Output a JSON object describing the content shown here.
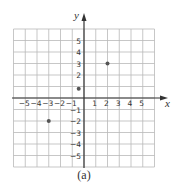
{
  "chart_data": {
    "type": "scatter",
    "title": "",
    "caption": "(a)",
    "xlabel": "x",
    "ylabel": "y",
    "xlim": [
      -6,
      6
    ],
    "ylim": [
      -6,
      6
    ],
    "grid": true,
    "x_ticks": [
      -5,
      -4,
      -3,
      -2,
      -1,
      1,
      2,
      3,
      4,
      5
    ],
    "x_tick_labels": [
      "−5",
      "−4",
      "−3",
      "−2",
      "−1",
      "1",
      "2",
      "3",
      "4",
      "5"
    ],
    "y_ticks": [
      5,
      4,
      3,
      2,
      -1,
      -2,
      -3,
      -4,
      -5
    ],
    "y_tick_labels": [
      "5",
      "4",
      "3",
      "2",
      "−1",
      "−2",
      "−3",
      "−4",
      "−5"
    ],
    "points": [
      {
        "x": 2,
        "y": 3
      },
      {
        "x": -3,
        "y": -2
      },
      {
        "x": -0.45,
        "y": 0.8
      }
    ],
    "colors": {
      "grid": "#b9b9b9",
      "axis": "#333333",
      "point": "#555555"
    }
  },
  "layout": {
    "origin_px": [
      84,
      98
    ],
    "unit_px_x": 11.75,
    "unit_px_y": 11.5
  }
}
